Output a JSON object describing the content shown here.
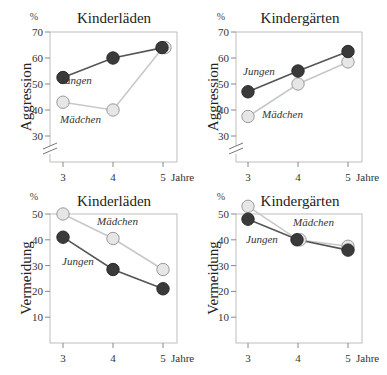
{
  "chart_data": [
    {
      "type": "line",
      "title": "Kinderläden",
      "ylabel": "Aggression",
      "yunit": "%",
      "xlabel": "Jahre",
      "x": [
        3,
        4,
        5
      ],
      "yticks": [
        30,
        40,
        50,
        60,
        70
      ],
      "ylim": [
        22,
        70
      ],
      "axis_break": true,
      "series": [
        {
          "name": "Jungen",
          "values": [
            52.5,
            60,
            64
          ]
        },
        {
          "name": "Mädchen",
          "values": [
            43,
            40,
            64
          ]
        }
      ]
    },
    {
      "type": "line",
      "title": "Kindergärten",
      "ylabel": "Aggression",
      "yunit": "%",
      "xlabel": "Jahre",
      "x": [
        3,
        4,
        5
      ],
      "yticks": [
        30,
        40,
        50,
        60,
        70
      ],
      "ylim": [
        22,
        70
      ],
      "axis_break": true,
      "series": [
        {
          "name": "Jungen",
          "values": [
            47,
            55,
            62.5
          ]
        },
        {
          "name": "Mädchen",
          "values": [
            37.5,
            50,
            58.5
          ]
        }
      ]
    },
    {
      "type": "line",
      "title": "Kinderläden",
      "ylabel": "Vermeidung",
      "yunit": "%",
      "xlabel": "Jahre",
      "x": [
        3,
        4,
        5
      ],
      "yticks": [
        10,
        20,
        30,
        40,
        50
      ],
      "ylim": [
        0,
        50
      ],
      "axis_break": false,
      "series": [
        {
          "name": "Jungen",
          "values": [
            41,
            28.5,
            21
          ]
        },
        {
          "name": "Mädchen",
          "values": [
            50,
            40.5,
            28.5
          ]
        }
      ]
    },
    {
      "type": "line",
      "title": "Kindergärten",
      "ylabel": "Vermeidung",
      "yunit": "%",
      "xlabel": "Jahre",
      "x": [
        3,
        4,
        5
      ],
      "yticks": [
        10,
        20,
        30,
        40,
        50
      ],
      "ylim": [
        0,
        50
      ],
      "axis_break": false,
      "series": [
        {
          "name": "Jungen",
          "values": [
            48,
            40,
            36
          ]
        },
        {
          "name": "Mädchen",
          "values": [
            53,
            40,
            37.5
          ]
        }
      ]
    }
  ],
  "colors": {
    "jungen_fill": "#3a3a3a",
    "jungen_line": "#555555",
    "maedchen_fill": "#e6e6e6",
    "maedchen_stroke": "#9a9a9a",
    "maedchen_line": "#c8c8c8",
    "axis": "#bdbdbd"
  }
}
